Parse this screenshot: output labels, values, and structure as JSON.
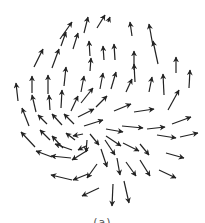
{
  "figure": {
    "type": "vector-field",
    "arrow_color": "#222222",
    "background": "#ffffff",
    "caption": "(a)"
  },
  "arrows": [
    [
      60,
      39,
      72,
      22
    ],
    [
      84,
      33,
      88,
      17
    ],
    [
      97,
      28,
      105,
      15
    ],
    [
      108,
      22,
      110,
      17
    ],
    [
      132,
      36,
      130,
      22
    ],
    [
      153,
      46,
      149,
      24
    ],
    [
      34,
      67,
      43,
      49
    ],
    [
      52,
      68,
      59,
      49
    ],
    [
      61,
      46,
      66,
      32
    ],
    [
      73,
      49,
      78,
      33
    ],
    [
      90,
      56,
      89,
      41
    ],
    [
      104,
      60,
      103,
      46
    ],
    [
      115,
      60,
      114,
      44
    ],
    [
      134,
      70,
      134,
      51
    ],
    [
      135,
      82,
      134,
      64
    ],
    [
      158,
      64,
      153,
      41
    ],
    [
      176,
      73,
      176,
      57
    ],
    [
      189,
      88,
      190,
      70
    ],
    [
      18,
      101,
      16,
      83
    ],
    [
      32,
      93,
      32,
      76
    ],
    [
      48,
      94,
      48,
      75
    ],
    [
      64,
      86,
      66,
      67
    ],
    [
      81,
      92,
      84,
      76
    ],
    [
      90,
      71,
      91,
      58
    ],
    [
      100,
      89,
      103,
      73
    ],
    [
      111,
      89,
      116,
      72
    ],
    [
      126,
      92,
      132,
      79
    ],
    [
      149,
      92,
      152,
      77
    ],
    [
      164,
      95,
      163,
      74
    ],
    [
      168,
      110,
      179,
      90
    ],
    [
      36,
      112,
      32,
      95
    ],
    [
      50,
      110,
      49,
      95
    ],
    [
      61,
      108,
      62,
      90
    ],
    [
      71,
      111,
      78,
      96
    ],
    [
      81,
      103,
      93,
      88
    ],
    [
      96,
      107,
      107,
      96
    ],
    [
      29,
      126,
      22,
      108
    ],
    [
      47,
      124,
      38,
      115
    ],
    [
      62,
      125,
      52,
      114
    ],
    [
      74,
      124,
      64,
      114
    ],
    [
      78,
      117,
      94,
      109
    ],
    [
      84,
      126,
      103,
      120
    ],
    [
      114,
      111,
      131,
      104
    ],
    [
      134,
      112,
      154,
      109
    ],
    [
      172,
      124,
      191,
      117
    ],
    [
      35,
      147,
      21,
      132
    ],
    [
      50,
      140,
      40,
      130
    ],
    [
      63,
      148,
      52,
      136
    ],
    [
      75,
      140,
      66,
      133
    ],
    [
      83,
      134,
      73,
      136
    ],
    [
      86,
      146,
      78,
      150
    ],
    [
      106,
      129,
      123,
      132
    ],
    [
      122,
      126,
      143,
      128
    ],
    [
      147,
      129,
      165,
      127
    ],
    [
      157,
      135,
      176,
      138
    ],
    [
      180,
      137,
      198,
      133
    ],
    [
      52,
      157,
      36,
      151
    ],
    [
      71,
      158,
      51,
      156
    ],
    [
      72,
      150,
      55,
      144
    ],
    [
      88,
      150,
      72,
      160
    ],
    [
      87,
      140,
      86,
      152
    ],
    [
      90,
      134,
      99,
      145
    ],
    [
      105,
      140,
      115,
      155
    ],
    [
      106,
      136,
      121,
      146
    ],
    [
      123,
      143,
      139,
      151
    ],
    [
      140,
      144,
      149,
      155
    ],
    [
      166,
      153,
      184,
      158
    ],
    [
      72,
      180,
      51,
      175
    ],
    [
      88,
      174,
      73,
      180
    ],
    [
      97,
      164,
      87,
      178
    ],
    [
      101,
      149,
      107,
      167
    ],
    [
      117,
      158,
      120,
      175
    ],
    [
      126,
      162,
      136,
      176
    ],
    [
      140,
      160,
      150,
      176
    ],
    [
      159,
      170,
      176,
      178
    ],
    [
      99,
      188,
      82,
      196
    ],
    [
      113,
      184,
      112,
      206
    ],
    [
      124,
      181,
      129,
      203
    ]
  ]
}
